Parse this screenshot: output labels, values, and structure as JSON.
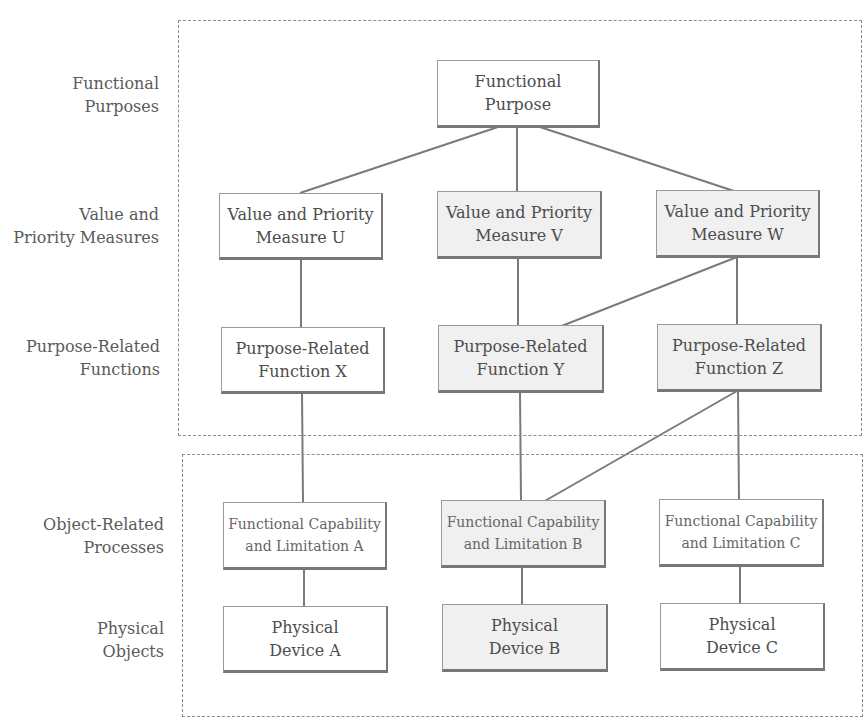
{
  "regions": [
    {
      "name": "intentional-region",
      "style": "dashed"
    },
    {
      "name": "physical-region",
      "style": "dashed"
    }
  ],
  "levels": [
    {
      "label": "Functional\nPurposes"
    },
    {
      "label": "Value and\nPriority  Measures"
    },
    {
      "label": "Purpose-Related\nFunctions"
    },
    {
      "label": "Object-Related\nProcesses"
    },
    {
      "label": "Physical\nObjects"
    }
  ],
  "nodes": {
    "functional_purpose": "Functional\nPurpose",
    "measure_u": "Value and Priority\nMeasure U",
    "measure_v": "Value and Priority\nMeasure V",
    "measure_w": "Value and Priority\nMeasure W",
    "function_x": "Purpose-Related\nFunction X",
    "function_y": "Purpose-Related\nFunction Y",
    "function_z": "Purpose-Related\nFunction Z",
    "capability_a": "Functional Capability\nand Limitation A",
    "capability_b": "Functional Capability\nand Limitation B",
    "capability_c": "Functional Capability\nand Limitation C",
    "device_a": "Physical\nDevice A",
    "device_b": "Physical\nDevice B",
    "device_c": "Physical\nDevice C"
  },
  "edges": [
    [
      "functional_purpose",
      "measure_u"
    ],
    [
      "functional_purpose",
      "measure_v"
    ],
    [
      "functional_purpose",
      "measure_w"
    ],
    [
      "measure_u",
      "function_x"
    ],
    [
      "measure_v",
      "function_y"
    ],
    [
      "measure_w",
      "function_y"
    ],
    [
      "measure_w",
      "function_z"
    ],
    [
      "function_x",
      "capability_a"
    ],
    [
      "function_y",
      "capability_b"
    ],
    [
      "function_z",
      "capability_b"
    ],
    [
      "function_z",
      "capability_c"
    ],
    [
      "capability_a",
      "device_a"
    ],
    [
      "capability_b",
      "device_b"
    ],
    [
      "capability_c",
      "device_c"
    ]
  ],
  "colors": {
    "line": "#7a7a7a",
    "dashed_border": "#8a8a8a",
    "shaded_fill": "#f0f0f0"
  }
}
